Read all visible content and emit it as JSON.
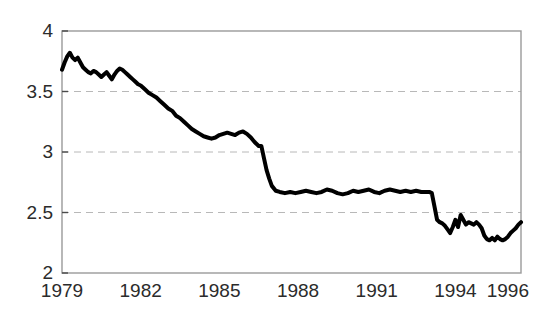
{
  "chart_data": {
    "type": "line",
    "title": "",
    "subtitle": "",
    "xlabel": "",
    "ylabel": "",
    "xlim": [
      1979.0,
      1996.5
    ],
    "ylim": [
      2,
      4
    ],
    "grid": "horizontal dashed gridlines at 2.5, 3, 3.5",
    "legend": "none",
    "legend_position": "none",
    "line_color": "#000000",
    "line_width_px": 4,
    "background_color": "#ffffff",
    "frame_color": "#9a9a9a",
    "gridline_color": "#b8b8b8",
    "y_ticks": [
      2,
      2.5,
      3,
      3.5,
      4
    ],
    "y_tick_labels": [
      "2",
      "2.5",
      "3",
      "3.5",
      "4"
    ],
    "x_ticks": [
      1979,
      1982,
      1985,
      1988,
      1991,
      1994,
      1996
    ],
    "x_tick_labels": [
      "1979",
      "1982",
      "1985",
      "1988",
      "1991",
      "1994",
      "1996"
    ],
    "series": [
      {
        "name": "series-1",
        "x": [
          1979.0,
          1979.1,
          1979.2,
          1979.3,
          1979.4,
          1979.5,
          1979.6,
          1979.7,
          1979.8,
          1979.9,
          1980.0,
          1980.1,
          1980.2,
          1980.3,
          1980.4,
          1980.5,
          1980.6,
          1980.7,
          1980.8,
          1980.9,
          1981.0,
          1981.1,
          1981.2,
          1981.3,
          1981.4,
          1981.5,
          1981.6,
          1981.7,
          1981.8,
          1981.9,
          1982.0,
          1982.15,
          1982.3,
          1982.45,
          1982.6,
          1982.75,
          1982.9,
          1983.05,
          1983.2,
          1983.35,
          1983.5,
          1983.65,
          1983.8,
          1983.95,
          1984.1,
          1984.25,
          1984.4,
          1984.55,
          1984.7,
          1984.85,
          1985.0,
          1985.15,
          1985.3,
          1985.45,
          1985.6,
          1985.75,
          1985.9,
          1986.05,
          1986.2,
          1986.35,
          1986.5,
          1986.6,
          1986.7,
          1986.8,
          1986.9,
          1987.0,
          1987.15,
          1987.3,
          1987.5,
          1987.7,
          1987.9,
          1988.1,
          1988.3,
          1988.5,
          1988.7,
          1988.9,
          1989.1,
          1989.3,
          1989.5,
          1989.7,
          1989.9,
          1990.1,
          1990.3,
          1990.5,
          1990.7,
          1990.9,
          1991.1,
          1991.3,
          1991.5,
          1991.7,
          1991.9,
          1992.1,
          1992.3,
          1992.5,
          1992.7,
          1992.9,
          1993.0,
          1993.1,
          1993.2,
          1993.3,
          1993.4,
          1993.5,
          1993.6,
          1993.7,
          1993.8,
          1993.9,
          1994.0,
          1994.1,
          1994.2,
          1994.3,
          1994.4,
          1994.5,
          1994.6,
          1994.7,
          1994.8,
          1994.9,
          1995.0,
          1995.1,
          1995.2,
          1995.3,
          1995.4,
          1995.5,
          1995.6,
          1995.7,
          1995.8,
          1995.9,
          1996.0,
          1996.1,
          1996.2,
          1996.3,
          1996.4,
          1996.5
        ],
        "y": [
          3.68,
          3.74,
          3.79,
          3.82,
          3.78,
          3.76,
          3.78,
          3.74,
          3.7,
          3.68,
          3.66,
          3.65,
          3.67,
          3.66,
          3.64,
          3.62,
          3.64,
          3.66,
          3.63,
          3.6,
          3.64,
          3.67,
          3.69,
          3.68,
          3.66,
          3.64,
          3.62,
          3.6,
          3.58,
          3.56,
          3.55,
          3.52,
          3.49,
          3.47,
          3.45,
          3.42,
          3.39,
          3.36,
          3.34,
          3.3,
          3.28,
          3.25,
          3.22,
          3.19,
          3.17,
          3.15,
          3.13,
          3.12,
          3.11,
          3.12,
          3.14,
          3.15,
          3.16,
          3.15,
          3.14,
          3.16,
          3.17,
          3.15,
          3.12,
          3.08,
          3.05,
          3.05,
          2.95,
          2.85,
          2.78,
          2.72,
          2.68,
          2.67,
          2.66,
          2.67,
          2.66,
          2.67,
          2.68,
          2.67,
          2.66,
          2.67,
          2.69,
          2.68,
          2.66,
          2.65,
          2.66,
          2.68,
          2.67,
          2.68,
          2.69,
          2.67,
          2.66,
          2.68,
          2.69,
          2.68,
          2.67,
          2.68,
          2.67,
          2.68,
          2.67,
          2.67,
          2.67,
          2.66,
          2.55,
          2.44,
          2.42,
          2.41,
          2.39,
          2.36,
          2.33,
          2.38,
          2.44,
          2.38,
          2.48,
          2.44,
          2.4,
          2.42,
          2.41,
          2.4,
          2.42,
          2.4,
          2.37,
          2.31,
          2.28,
          2.27,
          2.29,
          2.27,
          2.3,
          2.28,
          2.27,
          2.28,
          2.3,
          2.33,
          2.35,
          2.37,
          2.4,
          2.42
        ]
      }
    ]
  },
  "axes": {
    "plot_left_px": 62,
    "plot_right_px": 521,
    "plot_top_px": 31,
    "plot_bottom_px": 273
  }
}
